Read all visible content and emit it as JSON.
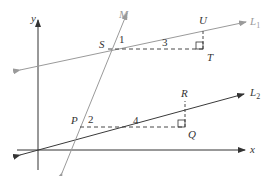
{
  "diagram": {
    "type": "geometry-slope-figure",
    "axes": {
      "x_label": "x",
      "y_label": "y"
    },
    "lines": [
      {
        "id": "L1",
        "label": "L",
        "subscript": "1",
        "color": "#9a9a9a"
      },
      {
        "id": "L2",
        "label": "L",
        "subscript": "2",
        "color": "#3a3a3a"
      },
      {
        "id": "M",
        "label": "M",
        "color": "#9a9a9a"
      }
    ],
    "points": {
      "S": "S",
      "T": "T",
      "U": "U",
      "P": "P",
      "Q": "Q",
      "R": "R"
    },
    "labels": {
      "angle1": "1",
      "angle2": "2",
      "run_upper": "3",
      "run_lower": "4"
    },
    "colors": {
      "axis": "#333333",
      "dark_line": "#3a3a3a",
      "light_line": "#9a9a9a",
      "text": "#333333",
      "light_text": "#9a9a9a"
    }
  }
}
